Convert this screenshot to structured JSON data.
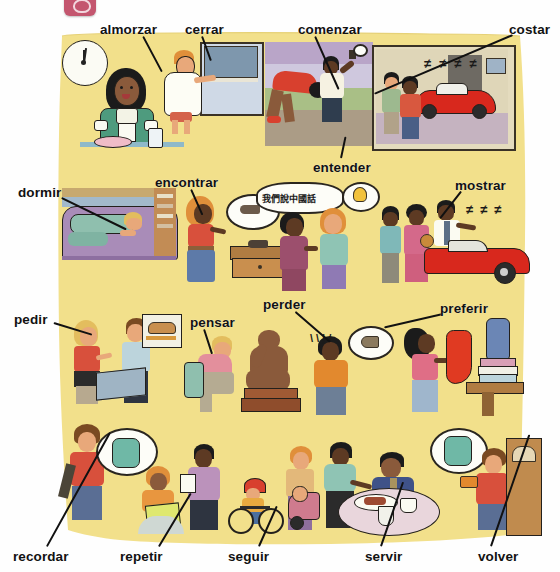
{
  "page": {
    "kind": "illustrated-vocabulary-plate",
    "language": "Spanish",
    "background_color": "#f2e08b",
    "margin_color": "#ffffff",
    "label_color": "#121212"
  },
  "top_icon": {
    "name": "app-icon",
    "color": "#c4566f"
  },
  "labels": [
    {
      "id": "almorzar",
      "text": "almorzar",
      "x": 100,
      "y": 22,
      "lx": 144,
      "ly": 36,
      "len": 40,
      "ang": 62
    },
    {
      "id": "cerrar",
      "text": "cerrar",
      "x": 185,
      "y": 22,
      "lx": 203,
      "ly": 36,
      "len": 26,
      "ang": 70
    },
    {
      "id": "comenzar",
      "text": "comenzar",
      "x": 298,
      "y": 22,
      "lx": 316,
      "ly": 36,
      "len": 58,
      "ang": 66
    },
    {
      "id": "costar",
      "text": "costar",
      "x": 509,
      "y": 22,
      "lx": 513,
      "ly": 36,
      "len": 150,
      "ang": 157
    },
    {
      "id": "entender",
      "text": "entender",
      "x": 313,
      "y": 160,
      "lx": 340,
      "ly": 158,
      "len": 22,
      "ang": -78
    },
    {
      "id": "encontrar",
      "text": "encontrar",
      "x": 155,
      "y": 175,
      "lx": 192,
      "ly": 189,
      "len": 28,
      "ang": 66
    },
    {
      "id": "mostrar",
      "text": "mostrar",
      "x": 455,
      "y": 178,
      "lx": 462,
      "ly": 192,
      "len": 34,
      "ang": 128
    },
    {
      "id": "dormir",
      "text": "dormir",
      "x": 18,
      "y": 185,
      "lx": 62,
      "ly": 197,
      "len": 72,
      "ang": 26
    },
    {
      "id": "pedir",
      "text": "pedir",
      "x": 14,
      "y": 312,
      "lx": 54,
      "ly": 322,
      "len": 40,
      "ang": 17
    },
    {
      "id": "pensar",
      "text": "pensar",
      "x": 190,
      "y": 315,
      "lx": 205,
      "ly": 329,
      "len": 26,
      "ang": 72
    },
    {
      "id": "perder",
      "text": "perder",
      "x": 263,
      "y": 297,
      "lx": 296,
      "ly": 311,
      "len": 46,
      "ang": 41
    },
    {
      "id": "preferir",
      "text": "preferir",
      "x": 440,
      "y": 301,
      "lx": 443,
      "ly": 315,
      "len": 60,
      "ang": 167
    },
    {
      "id": "recordar",
      "text": "recordar",
      "x": 13,
      "y": 549,
      "lx": 46,
      "ly": 546,
      "len": 130,
      "ang": -61
    },
    {
      "id": "repetir",
      "text": "repetir",
      "x": 120,
      "y": 549,
      "lx": 158,
      "ly": 546,
      "len": 62,
      "ang": -59
    },
    {
      "id": "seguir",
      "text": "seguir",
      "x": 228,
      "y": 549,
      "lx": 258,
      "ly": 546,
      "len": 44,
      "ang": -66
    },
    {
      "id": "servir",
      "text": "servir",
      "x": 365,
      "y": 549,
      "lx": 380,
      "ly": 546,
      "len": 68,
      "ang": -71
    },
    {
      "id": "volver",
      "text": "volver",
      "x": 478,
      "y": 549,
      "lx": 490,
      "ly": 546,
      "len": 118,
      "ang": -71
    }
  ],
  "scenes": {
    "almorzar": {
      "caption": "almorzar",
      "detail": "woman eating lunch at a table, wall clock at 12"
    },
    "cerrar": {
      "caption": "cerrar",
      "detail": "person closing a window"
    },
    "comenzar": {
      "caption": "comenzar",
      "detail": "runner at starting blocks, official with starter pistol"
    },
    "costar": {
      "caption": "costar",
      "detail": "two men looking at a red sports car with price marks"
    },
    "dormir": {
      "caption": "dormir",
      "detail": "person sleeping on a purple couch"
    },
    "encontrar": {
      "caption": "encontrar",
      "detail": "woman finding a mouse in a drawer"
    },
    "entender": {
      "caption": "entender",
      "detail": "two women talking, speech bubble with Chinese text and lightbulb"
    },
    "mostrar": {
      "caption": "mostrar",
      "detail": "salesman showing a red convertible to customers"
    },
    "pedir": {
      "caption": "pedir",
      "detail": "woman ordering at a fast-food counter"
    },
    "pensar": {
      "caption": "pensar",
      "detail": "student posed like The Thinker statue"
    },
    "perder": {
      "caption": "perder",
      "detail": "man who lost his keys, thought bubble with keys"
    },
    "preferir": {
      "caption": "preferir",
      "detail": "woman choosing a red sweater over a blue one"
    },
    "recordar": {
      "caption": "recordar",
      "detail": "student remembering a forgotten backpack"
    },
    "repetir": {
      "caption": "repetir",
      "detail": "woman reading aloud, man repeating from a card"
    },
    "seguir": {
      "caption": "seguir",
      "detail": "child on a bicycle followed by a woman with a stroller"
    },
    "servir": {
      "caption": "servir",
      "detail": "waiter serving a plate to a seated diner"
    },
    "volver": {
      "caption": "volver",
      "detail": "student returning through a doorway"
    }
  },
  "speech_bubble": {
    "text": "我們說中國話"
  },
  "clock": {
    "time_shown": "12:00"
  }
}
